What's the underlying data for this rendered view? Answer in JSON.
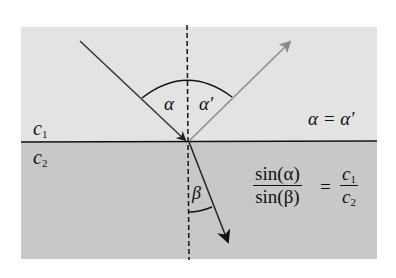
{
  "diagram": {
    "media": [
      {
        "label": "c",
        "subscript": "1",
        "color": "#e3e3e3"
      },
      {
        "label": "c",
        "subscript": "2",
        "color": "#c8c8c8"
      }
    ],
    "angles": {
      "incident": "α",
      "reflected": "α′",
      "refracted": "β"
    },
    "equations": {
      "reflection": "α = α′",
      "snell_num": "sin(α)",
      "snell_den": "sin(β)",
      "snell_eq": "=",
      "snell_rhs_num": "c",
      "snell_rhs_num_sub": "1",
      "snell_rhs_den": "c",
      "snell_rhs_den_sub": "2"
    },
    "colors": {
      "incident_ray": "#333333",
      "reflected_ray": "#8a8a8a",
      "refracted_ray": "#222222",
      "boundary": "#111111"
    }
  }
}
